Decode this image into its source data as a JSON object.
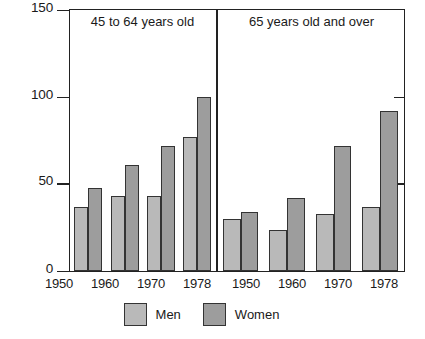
{
  "chart_data": {
    "type": "bar",
    "title": "",
    "xlabel": "",
    "ylabel": "",
    "ylim": [
      0,
      150
    ],
    "yticks": [
      0,
      50,
      100,
      150
    ],
    "ytick_labels": [
      "0",
      "50",
      "100",
      "150"
    ],
    "grid": false,
    "legend_position": "bottom-center",
    "categories": [
      "1950",
      "1960",
      "1970",
      "1978"
    ],
    "panels": [
      {
        "title": "45 to 64 years old",
        "categories": [
          "1950",
          "1960",
          "1970",
          "1978"
        ],
        "series": [
          {
            "name": "Men",
            "values": [
              37,
              43,
              43,
              77
            ]
          },
          {
            "name": "Women",
            "values": [
              48,
              61,
              72,
              100
            ]
          }
        ]
      },
      {
        "title": "65 years old and over",
        "categories": [
          "1950",
          "1960",
          "1970",
          "1978"
        ],
        "series": [
          {
            "name": "Men",
            "values": [
              30,
              24,
              33,
              37
            ]
          },
          {
            "name": "Women",
            "values": [
              34,
              42,
              72,
              92
            ]
          }
        ]
      }
    ],
    "legend": [
      {
        "label": "Men",
        "color": "#b9b9b9"
      },
      {
        "label": "Women",
        "color": "#9d9d9d"
      }
    ]
  },
  "axis": {
    "y": {
      "t150": "150",
      "t100": "100",
      "t50": "50",
      "t0": "0"
    }
  },
  "panel_left": {
    "title": "45 to 64 years old",
    "x": {
      "c0": "1950",
      "c1": "1960",
      "c2": "1970",
      "c3": "1978"
    }
  },
  "panel_right": {
    "title": "65 years old and over",
    "x": {
      "c0": "1950",
      "c1": "1960",
      "c2": "1970",
      "c3": "1978"
    }
  },
  "legend": {
    "men": "Men",
    "women": "Women"
  },
  "colors": {
    "men": "#b9b9b9",
    "women": "#9d9d9d",
    "axis": "#222222",
    "bar_outline": "#333333",
    "background": "#ffffff"
  }
}
